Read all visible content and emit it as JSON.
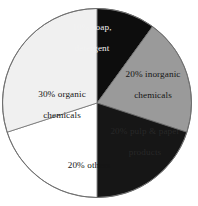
{
  "chart_data": {
    "type": "pie",
    "title": "",
    "subtitle": "",
    "xlabel": "",
    "ylabel": "",
    "legend": "none",
    "grid": false,
    "units": "percent",
    "total": 100,
    "start_angle_deg": 0,
    "direction": "clockwise",
    "categories": [
      "10% soap, detergent",
      "20% inorganic chemicals",
      "20% pulp & paper products",
      "20% others",
      "30% organic chemicals"
    ],
    "values": [
      10,
      20,
      20,
      20,
      30
    ],
    "slices": [
      {
        "key": "soap-detergent",
        "label": "10% soap,\ndetergent",
        "label_line1": "10% soap,",
        "label_line2": "detergent",
        "value": 10,
        "color": "#0d0d0d",
        "label_color": "#f2f2f2"
      },
      {
        "key": "inorganic-chemicals",
        "label": "20% inorganic\nchemicals",
        "label_line1": "20% inorganic",
        "label_line2": "chemicals",
        "value": 20,
        "color": "#9a9a9a",
        "label_color": "#151515"
      },
      {
        "key": "pulp-paper-products",
        "label": "20% pulp & paper\nproducts",
        "label_line1": "20% pulp & paper",
        "label_line2": "products",
        "value": 20,
        "color": "#161616",
        "label_color": "#2b2b2b"
      },
      {
        "key": "others",
        "label": "20% others",
        "label_line1": "20% others",
        "label_line2": "",
        "value": 20,
        "color": "#ffffff",
        "label_color": "#151515"
      },
      {
        "key": "organic-chemicals",
        "label": "30% organic\nchemicals",
        "label_line1": "30% organic",
        "label_line2": "chemicals",
        "value": 30,
        "color": "#f0f0f0",
        "label_color": "#151515"
      }
    ],
    "outline_color": "#6e6e6e"
  }
}
